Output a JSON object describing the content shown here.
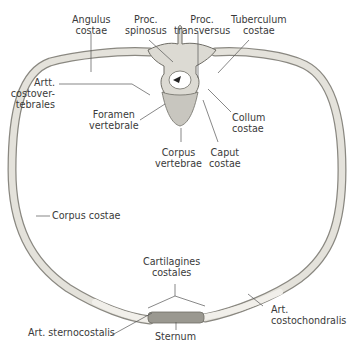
{
  "figure": {
    "colors": {
      "bone": "#e4e2db",
      "bone_edge": "#8a8881",
      "cartilage": "#eceae4",
      "sternum": "#9a9890",
      "leader": "#555555",
      "text": "#3a3a3a"
    },
    "labels": {
      "angulus_costae": [
        "Angulus",
        "costae"
      ],
      "proc_spinosus": [
        "Proc.",
        "spinosus"
      ],
      "proc_transversus": [
        "Proc.",
        "transversus"
      ],
      "tuberculum_costae": [
        "Tuberculum",
        "costae"
      ],
      "artt_costovertebrales": [
        "Artt.",
        "costover-",
        "tebrales"
      ],
      "foramen_vertebrale": [
        "Foramen",
        "vertebrale"
      ],
      "collum_costae": [
        "Collum",
        "costae"
      ],
      "corpus_vertebrae": [
        "Corpus",
        "vertebrae"
      ],
      "caput_costae": [
        "Caput",
        "costae"
      ],
      "corpus_costae": [
        "Corpus costae"
      ],
      "cartilagines_costales": [
        "Cartilagines",
        "costales"
      ],
      "art_sternocostalis": [
        "Art. sternocostalis"
      ],
      "sternum": [
        "Sternum"
      ],
      "art_costochondralis": [
        "Art.",
        "costochondralis"
      ]
    }
  }
}
